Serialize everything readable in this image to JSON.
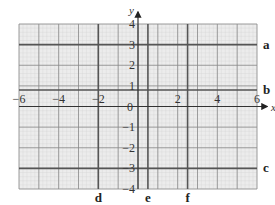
{
  "figure": {
    "axis_labels": {
      "x": "x",
      "y": "y"
    },
    "x_range": [
      -6,
      6
    ],
    "y_range": [
      -4,
      4
    ],
    "x_ticks": [
      {
        "value": -6,
        "label": "−6"
      },
      {
        "value": -4,
        "label": "−4"
      },
      {
        "value": -2,
        "label": "−2"
      },
      {
        "value": 2,
        "label": "2"
      },
      {
        "value": 4,
        "label": "4"
      },
      {
        "value": 6,
        "label": "6"
      }
    ],
    "origin_label": "0",
    "y_ticks": [
      {
        "value": 4,
        "label": "4"
      },
      {
        "value": 3,
        "label": "3"
      },
      {
        "value": 2,
        "label": "2"
      },
      {
        "value": 1,
        "label": "1"
      },
      {
        "value": -1,
        "label": "−1"
      },
      {
        "value": -2,
        "label": "−2"
      },
      {
        "value": -3,
        "label": "−3"
      },
      {
        "value": -4,
        "label": "−4"
      }
    ],
    "horizontal_lines": [
      {
        "label": "a",
        "y": 3
      },
      {
        "label": "b",
        "y": 0.8
      },
      {
        "label": "c",
        "y": -3
      }
    ],
    "vertical_lines": [
      {
        "label": "d",
        "x": -2
      },
      {
        "label": "e",
        "x": 0.5
      },
      {
        "label": "f",
        "x": 2.5
      }
    ],
    "colors": {
      "grid_bg": "#ececec",
      "grid_minor": "#cfcfcf",
      "grid_major": "#8a8a8a",
      "highlight_line": "#555555",
      "axis": "#333333"
    }
  }
}
